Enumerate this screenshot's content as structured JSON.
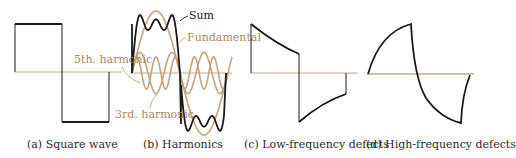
{
  "colors": {
    "wave": "#1a1a1a",
    "harmonic": "#c4a27a",
    "axis": "#c9a882",
    "label_tan": "#a8875f",
    "caption": "#2a2a2a"
  },
  "panels": [
    {
      "id": "a",
      "caption": "(a) Square wave"
    },
    {
      "id": "b",
      "caption": "(b) Harmonics",
      "labels": {
        "sum": "Sum",
        "fundamental": "Fundamental",
        "fifth": "5th. harmonic",
        "third": "3rd. harmonic"
      }
    },
    {
      "id": "c",
      "caption": "(c) Low-frequency defects"
    },
    {
      "id": "d",
      "caption": "(d) High-frequency defects"
    }
  ]
}
